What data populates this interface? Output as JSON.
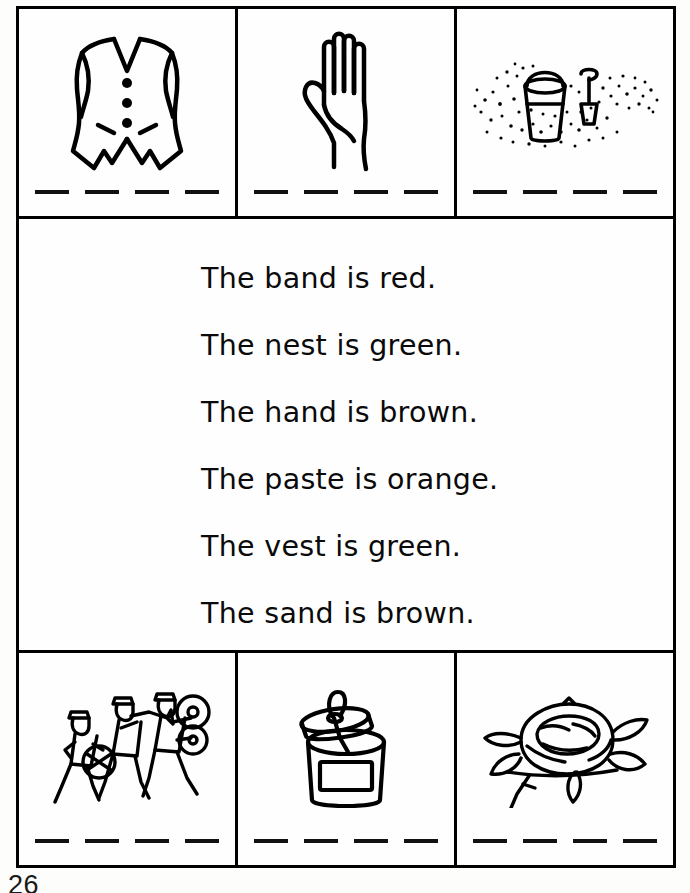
{
  "page": {
    "page_number": "26",
    "ink_color": "#000000",
    "paper_color": "#fefefe"
  },
  "top_row": [
    {
      "word": "vest",
      "icon": "vest-icon",
      "blank_dashes": 4
    },
    {
      "word": "hand",
      "icon": "hand-icon",
      "blank_dashes": 4
    },
    {
      "word": "sand",
      "icon": "sand-pail-icon",
      "blank_dashes": 4
    }
  ],
  "bottom_row": [
    {
      "word": "band",
      "icon": "marching-band-icon",
      "blank_dashes": 4
    },
    {
      "word": "paste",
      "icon": "paste-jar-icon",
      "blank_dashes": 4
    },
    {
      "word": "nest",
      "icon": "birds-nest-icon",
      "blank_dashes": 4
    }
  ],
  "sentences": [
    "The band is red.",
    "The nest is green.",
    "The hand is brown.",
    "The paste is orange.",
    "The vest is green.",
    "The sand is brown."
  ]
}
